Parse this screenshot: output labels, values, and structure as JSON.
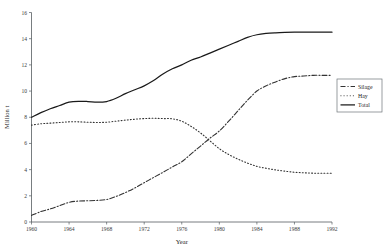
{
  "chart_data": {
    "type": "line",
    "title": "",
    "xlabel": "Year",
    "ylabel": "Million t",
    "xlim": [
      1960,
      1992
    ],
    "ylim": [
      0,
      16
    ],
    "grid": false,
    "legend_position": "right",
    "x_ticks": [
      1960,
      1964,
      1968,
      1972,
      1976,
      1980,
      1984,
      1988,
      1992
    ],
    "x_tick_labels": [
      "1960",
      "1964",
      "1968",
      "1972",
      "1976",
      "1980",
      "1984",
      "1988",
      "1992"
    ],
    "y_ticks": [
      0,
      2,
      4,
      6,
      8,
      10,
      12,
      14,
      16
    ],
    "y_tick_labels": [
      "0",
      "2",
      "4",
      "6",
      "8",
      "10",
      "12",
      "14",
      "16"
    ],
    "x": [
      1960,
      1961,
      1962,
      1963,
      1964,
      1965,
      1966,
      1967,
      1968,
      1969,
      1970,
      1971,
      1972,
      1973,
      1974,
      1975,
      1976,
      1977,
      1978,
      1979,
      1980,
      1981,
      1982,
      1983,
      1984,
      1985,
      1986,
      1987,
      1988,
      1989,
      1990,
      1991,
      1992
    ],
    "series": [
      {
        "name": "Silage",
        "line_style": "dash-dot",
        "color": "#333333",
        "values": [
          0.5,
          0.8,
          1.0,
          1.25,
          1.5,
          1.6,
          1.62,
          1.65,
          1.72,
          1.95,
          2.25,
          2.6,
          3.0,
          3.4,
          3.8,
          4.2,
          4.6,
          5.2,
          5.8,
          6.4,
          6.95,
          7.7,
          8.5,
          9.3,
          10.0,
          10.4,
          10.7,
          10.95,
          11.1,
          11.15,
          11.2,
          11.2,
          11.2
        ]
      },
      {
        "name": "Hay",
        "line_style": "dotted",
        "color": "#333333",
        "values": [
          7.4,
          7.5,
          7.55,
          7.6,
          7.65,
          7.65,
          7.62,
          7.6,
          7.62,
          7.7,
          7.78,
          7.85,
          7.9,
          7.92,
          7.9,
          7.88,
          7.7,
          7.3,
          6.8,
          6.2,
          5.6,
          5.15,
          4.8,
          4.5,
          4.25,
          4.1,
          3.98,
          3.88,
          3.8,
          3.76,
          3.73,
          3.72,
          3.72
        ]
      },
      {
        "name": "Total",
        "line_style": "solid",
        "color": "#1a1a1a",
        "values": [
          8.0,
          8.35,
          8.65,
          8.9,
          9.15,
          9.22,
          9.2,
          9.15,
          9.2,
          9.45,
          9.8,
          10.1,
          10.4,
          10.8,
          11.3,
          11.7,
          12.0,
          12.35,
          12.6,
          12.9,
          13.2,
          13.5,
          13.8,
          14.1,
          14.3,
          14.4,
          14.45,
          14.48,
          14.5,
          14.5,
          14.5,
          14.5,
          14.5
        ]
      }
    ]
  },
  "legend": {
    "entries": [
      {
        "label": "Silage"
      },
      {
        "label": "Hay"
      },
      {
        "label": "Total"
      }
    ]
  },
  "axes": {
    "x_title": "Year",
    "y_title": "Million t"
  }
}
